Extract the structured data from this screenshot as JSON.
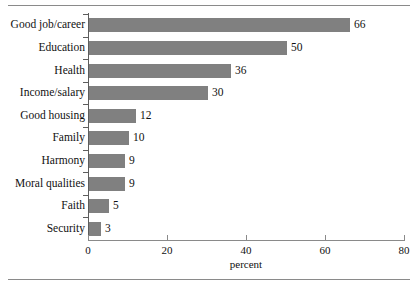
{
  "figure": {
    "top_rule": "",
    "bottom_rule": ""
  },
  "chart_data": {
    "type": "bar",
    "orientation": "horizontal",
    "title": "",
    "subtitle": "",
    "xlabel": "percent",
    "ylabel": "",
    "categories": [
      "Good job/career",
      "Education",
      "Health",
      "Income/salary",
      "Good housing",
      "Family",
      "Harmony",
      "Moral qualities",
      "Faith",
      "Security"
    ],
    "values": [
      66,
      50,
      36,
      30,
      12,
      10,
      9,
      9,
      5,
      3
    ],
    "data_labels": [
      "66",
      "50",
      "36",
      "30",
      "12",
      "10",
      "9",
      "9",
      "5",
      "3"
    ],
    "xlim": [
      0,
      80
    ],
    "xticks": [
      0,
      20,
      40,
      60,
      80
    ],
    "xticklabels": [
      "0",
      "20",
      "40",
      "60",
      "80"
    ],
    "grid": false,
    "legend": null,
    "bar_color": "#808080",
    "axis_color": "#8a8a8a",
    "text_color": "#111111",
    "background": "#ffffff"
  }
}
